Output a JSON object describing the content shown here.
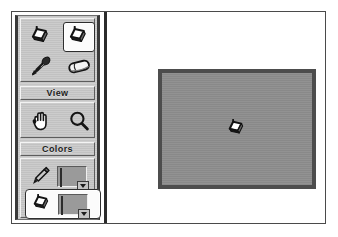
{
  "app": {
    "title": "Paint Tool Palette",
    "window_background": "#ffffff",
    "palette_background": "#b8b8b8",
    "frame_color": "#4a4a4a"
  },
  "palette": {
    "tools_group": {
      "name": "tools",
      "items": [
        {
          "id": "fill-unselected",
          "icon": "paint-bucket-icon",
          "label": "Paint Bucket",
          "selected": false
        },
        {
          "id": "fill-selected",
          "icon": "paint-bucket-icon",
          "label": "Fill",
          "selected": true
        },
        {
          "id": "eyedropper",
          "icon": "eyedropper-icon",
          "label": "Eyedropper",
          "selected": false
        },
        {
          "id": "eraser",
          "icon": "eraser-icon",
          "label": "Eraser",
          "selected": false
        }
      ]
    },
    "view_group": {
      "title": "View",
      "items": [
        {
          "id": "hand",
          "icon": "hand-icon",
          "label": "Hand",
          "selected": false
        },
        {
          "id": "zoom",
          "icon": "magnifying-glass-icon",
          "label": "Zoom",
          "selected": false
        }
      ]
    },
    "colors_group": {
      "title": "Colors",
      "rows": [
        {
          "id": "foreground",
          "icon": "pencil-icon",
          "label": "Pencil Color",
          "swatch_color": "#2b2b2b",
          "has_dropdown": true,
          "selected": false
        },
        {
          "id": "background",
          "icon": "paint-bucket-icon",
          "label": "Fill Color",
          "swatch_color": "#9c9c9c",
          "has_dropdown": true,
          "selected": true
        }
      ]
    }
  },
  "canvas": {
    "name": "document-canvas",
    "fill_color": "#8e8e8e",
    "border_color": "#4d4d4d",
    "cursor": {
      "icon": "paint-bucket-cursor",
      "label": "Paint Bucket Cursor"
    }
  }
}
